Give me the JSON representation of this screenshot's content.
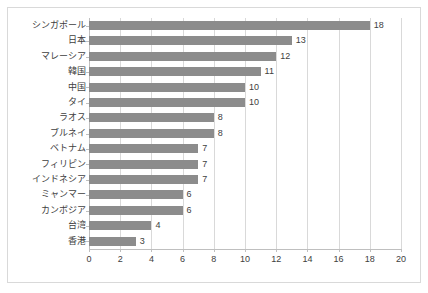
{
  "chart": {
    "frame_border_color": "#d9d9d9",
    "bar_color": "#8c8c8c",
    "gridline_color": "#d9d9d9",
    "axis_color": "#bfbfbf",
    "text_color": "#404040"
  },
  "chart_data": {
    "type": "bar",
    "orientation": "horizontal",
    "title": "",
    "subtitle": "",
    "xlabel": "",
    "ylabel": "",
    "xlim": [
      0,
      20
    ],
    "xticks": [
      0,
      2,
      4,
      6,
      8,
      10,
      12,
      14,
      16,
      18,
      20
    ],
    "grid": true,
    "legend": false,
    "data_labels": true,
    "categories": [
      "シンガポール",
      "日本",
      "マレーシア",
      "韓国",
      "中国",
      "タイ",
      "ラオス",
      "ブルネイ",
      "ベトナム",
      "フィリピン",
      "インドネシア",
      "ミャンマー",
      "カンボジア",
      "台湾",
      "香港"
    ],
    "values": [
      18,
      13,
      12,
      11,
      10,
      10,
      8,
      8,
      7,
      7,
      7,
      6,
      6,
      4,
      3
    ],
    "value_labels": [
      "18",
      "13",
      "12",
      "11",
      "10",
      "10",
      "8",
      "8",
      "7",
      "7",
      "7",
      "6",
      "6",
      "4",
      "3"
    ],
    "xtick_labels": [
      "0",
      "2",
      "4",
      "6",
      "8",
      "10",
      "12",
      "14",
      "16",
      "18",
      "20"
    ]
  }
}
